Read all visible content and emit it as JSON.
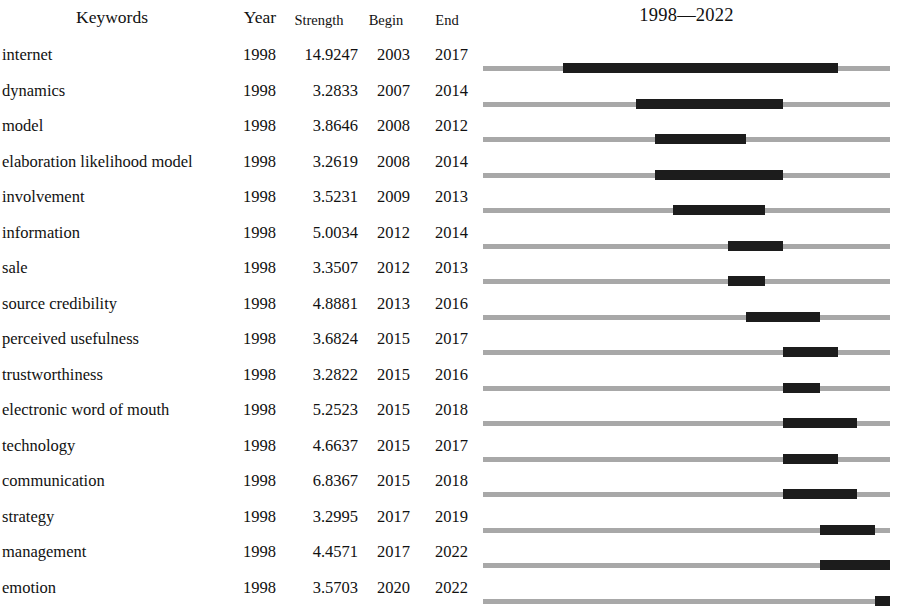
{
  "header": {
    "keywords_label": "Keywords",
    "year_label": "Year",
    "strength_label": "Strength",
    "begin_label": "Begin",
    "end_label": "End",
    "range_label": "1998—2022"
  },
  "chart_data": {
    "type": "table",
    "axis_start": 1998,
    "axis_end": 2022,
    "columns": [
      "Keywords",
      "Year",
      "Strength",
      "Begin",
      "End"
    ],
    "bar_color": "#1c1c1c",
    "track_color": "#a8a8a8",
    "rows": [
      {
        "keyword": "internet",
        "year": "1998",
        "strength": "14.9247",
        "begin": "2003",
        "end": "2017",
        "begin_num": 2003,
        "end_num": 2017
      },
      {
        "keyword": "dynamics",
        "year": "1998",
        "strength": "3.2833",
        "begin": "2007",
        "end": "2014",
        "begin_num": 2007,
        "end_num": 2014
      },
      {
        "keyword": "model",
        "year": "1998",
        "strength": "3.8646",
        "begin": "2008",
        "end": "2012",
        "begin_num": 2008,
        "end_num": 2012
      },
      {
        "keyword": "elaboration likelihood model",
        "year": "1998",
        "strength": "3.2619",
        "begin": "2008",
        "end": "2014",
        "begin_num": 2008,
        "end_num": 2014
      },
      {
        "keyword": "involvement",
        "year": "1998",
        "strength": "3.5231",
        "begin": "2009",
        "end": "2013",
        "begin_num": 2009,
        "end_num": 2013
      },
      {
        "keyword": "information",
        "year": "1998",
        "strength": "5.0034",
        "begin": "2012",
        "end": "2014",
        "begin_num": 2012,
        "end_num": 2014
      },
      {
        "keyword": "sale",
        "year": "1998",
        "strength": "3.3507",
        "begin": "2012",
        "end": "2013",
        "begin_num": 2012,
        "end_num": 2013
      },
      {
        "keyword": "source credibility",
        "year": "1998",
        "strength": "4.8881",
        "begin": "2013",
        "end": "2016",
        "begin_num": 2013,
        "end_num": 2016
      },
      {
        "keyword": "perceived usefulness",
        "year": "1998",
        "strength": "3.6824",
        "begin": "2015",
        "end": "2017",
        "begin_num": 2015,
        "end_num": 2017
      },
      {
        "keyword": "trustworthiness",
        "year": "1998",
        "strength": "3.2822",
        "begin": "2015",
        "end": "2016",
        "begin_num": 2015,
        "end_num": 2016
      },
      {
        "keyword": "electronic word of mouth",
        "year": "1998",
        "strength": "5.2523",
        "begin": "2015",
        "end": "2018",
        "begin_num": 2015,
        "end_num": 2018
      },
      {
        "keyword": "technology",
        "year": "1998",
        "strength": "4.6637",
        "begin": "2015",
        "end": "2017",
        "begin_num": 2015,
        "end_num": 2017
      },
      {
        "keyword": "communication",
        "year": "1998",
        "strength": "6.8367",
        "begin": "2015",
        "end": "2018",
        "begin_num": 2015,
        "end_num": 2018
      },
      {
        "keyword": "strategy",
        "year": "1998",
        "strength": "3.2995",
        "begin": "2017",
        "end": "2019",
        "begin_num": 2017,
        "end_num": 2019
      },
      {
        "keyword": "management",
        "year": "1998",
        "strength": "4.4571",
        "begin": "2017",
        "end": "2022",
        "begin_num": 2017,
        "end_num": 2022
      },
      {
        "keyword": "emotion",
        "year": "1998",
        "strength": "3.5703",
        "begin": "2020",
        "end": "2022",
        "begin_num": 2020,
        "end_num": 2022
      }
    ]
  }
}
